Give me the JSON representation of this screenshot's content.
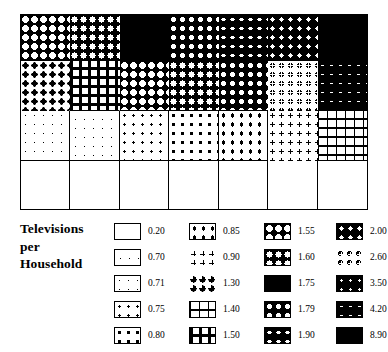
{
  "chart_data": {
    "type": "map",
    "title": "Televisions per Household",
    "legend_title_lines": [
      "Televisions",
      "per",
      "Household"
    ],
    "classes": [
      {
        "value": "0.20",
        "num": 0.2,
        "pattern": "p020"
      },
      {
        "value": "0.70",
        "num": 0.7,
        "pattern": "p070"
      },
      {
        "value": "0.71",
        "num": 0.71,
        "pattern": "p071"
      },
      {
        "value": "0.75",
        "num": 0.75,
        "pattern": "p075"
      },
      {
        "value": "0.80",
        "num": 0.8,
        "pattern": "p080"
      },
      {
        "value": "0.85",
        "num": 0.85,
        "pattern": "p085"
      },
      {
        "value": "0.90",
        "num": 0.9,
        "pattern": "p090"
      },
      {
        "value": "1.30",
        "num": 1.3,
        "pattern": "p130"
      },
      {
        "value": "1.40",
        "num": 1.4,
        "pattern": "p140"
      },
      {
        "value": "1.50",
        "num": 1.5,
        "pattern": "p150"
      },
      {
        "value": "1.55",
        "num": 1.55,
        "pattern": "p155"
      },
      {
        "value": "1.60",
        "num": 1.6,
        "pattern": "p160"
      },
      {
        "value": "1.75",
        "num": 1.75,
        "pattern": "p175"
      },
      {
        "value": "1.79",
        "num": 1.79,
        "pattern": "p179"
      },
      {
        "value": "1.90",
        "num": 1.9,
        "pattern": "p190"
      },
      {
        "value": "2.00",
        "num": 2.0,
        "pattern": "p200"
      },
      {
        "value": "2.60",
        "num": 2.6,
        "pattern": "p260"
      },
      {
        "value": "3.50",
        "num": 3.5,
        "pattern": "p350"
      },
      {
        "value": "4.20",
        "num": 4.2,
        "pattern": "p420"
      },
      {
        "value": "8.90",
        "num": 8.9,
        "pattern": "p890"
      }
    ],
    "legend_columns": [
      {
        "index": 0,
        "rows": [
          {
            "value": "0.20",
            "pattern": "p020"
          },
          {
            "value": "0.70",
            "pattern": "p070"
          },
          {
            "value": "0.71",
            "pattern": "p071"
          },
          {
            "value": "0.75",
            "pattern": "p075"
          },
          {
            "value": "0.80",
            "pattern": "p080"
          }
        ]
      },
      {
        "index": 1,
        "rows": [
          {
            "value": "0.85",
            "pattern": "p085"
          },
          {
            "value": "0.90",
            "pattern": "p090"
          },
          {
            "value": "1.30",
            "pattern": "p130"
          },
          {
            "value": "1.40",
            "pattern": "p140"
          },
          {
            "value": "1.50",
            "pattern": "p150"
          }
        ]
      },
      {
        "index": 2,
        "rows": [
          {
            "value": "1.55",
            "pattern": "p155"
          },
          {
            "value": "1.60",
            "pattern": "p160"
          },
          {
            "value": "1.75",
            "pattern": "p175"
          },
          {
            "value": "1.79",
            "pattern": "p179"
          },
          {
            "value": "1.90",
            "pattern": "p190"
          }
        ]
      },
      {
        "index": 3,
        "rows": [
          {
            "value": "2.00",
            "pattern": "p200"
          },
          {
            "value": "2.60",
            "pattern": "p260"
          },
          {
            "value": "3.50",
            "pattern": "p350"
          },
          {
            "value": "4.20",
            "pattern": "p420"
          },
          {
            "value": "8.90",
            "pattern": "p890"
          }
        ]
      }
    ],
    "map_grid": {
      "columns": 7,
      "rows": 4,
      "cells": [
        [
          {
            "pattern": "p155",
            "value": "1.55"
          },
          {
            "pattern": "p160",
            "value": "1.60"
          },
          {
            "pattern": "p175",
            "value": "1.75"
          },
          {
            "pattern": "p179",
            "value": "1.79"
          },
          {
            "pattern": "p190",
            "value": "1.90"
          },
          {
            "pattern": "p200",
            "value": "2.00"
          },
          {
            "pattern": "p890",
            "value": "8.90"
          }
        ],
        [
          {
            "pattern": "p130",
            "value": "1.30"
          },
          {
            "pattern": "p150",
            "value": "1.50"
          },
          {
            "pattern": "p155",
            "value": "1.55"
          },
          {
            "pattern": "p160",
            "value": "1.60"
          },
          {
            "pattern": "p179",
            "value": "1.79"
          },
          {
            "pattern": "p260",
            "value": "2.60"
          },
          {
            "pattern": "p420",
            "value": "4.20"
          }
        ],
        [
          {
            "pattern": "p071",
            "value": "0.71"
          },
          {
            "pattern": "p070",
            "value": "0.70"
          },
          {
            "pattern": "p075",
            "value": "0.75"
          },
          {
            "pattern": "p080",
            "value": "0.80"
          },
          {
            "pattern": "p085",
            "value": "0.85"
          },
          {
            "pattern": "p090",
            "value": "0.90"
          },
          {
            "pattern": "p140",
            "value": "1.40"
          }
        ],
        [
          {
            "pattern": "p020",
            "value": "0.20"
          },
          {
            "pattern": "p020",
            "value": "0.20"
          },
          {
            "pattern": "p020",
            "value": "0.20"
          },
          {
            "pattern": "p020",
            "value": "0.20"
          },
          {
            "pattern": "p020",
            "value": "0.20"
          },
          {
            "pattern": "p020",
            "value": "0.20"
          },
          {
            "pattern": "p020",
            "value": "0.20"
          }
        ]
      ]
    },
    "colors": {
      "ink": "#000000",
      "paper": "#ffffff"
    },
    "grid": true,
    "legend_position": "bottom"
  }
}
